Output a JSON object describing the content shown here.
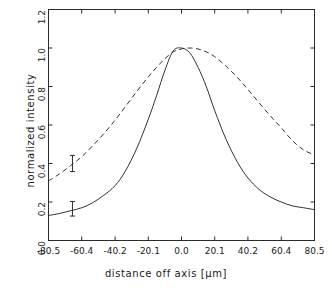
{
  "chart_data": {
    "type": "line",
    "title": "",
    "xlabel": "distance off axis [μm]",
    "ylabel": "normalized intensity",
    "xlim": [
      -80.5,
      80.5
    ],
    "ylim": [
      0.0,
      1.2
    ],
    "xticks": [
      -80.5,
      -60.4,
      -40.2,
      -20.1,
      0.0,
      20.1,
      40.2,
      60.4,
      80.5
    ],
    "xtick_labels": [
      "-80.5",
      "-60.4",
      "-40.2",
      "-20.1",
      "0.0",
      "20.1",
      "40.2",
      "60.4",
      "80.5"
    ],
    "yticks": [
      0.0,
      0.2,
      0.4,
      0.6,
      0.8,
      1.0,
      1.2
    ],
    "ytick_labels": [
      "0.0",
      "0.2",
      "0.4",
      "0.6",
      "0.8",
      "1.0",
      "1.2"
    ],
    "grid": false,
    "legend": "none",
    "series": [
      {
        "name": "solid-curve",
        "style": "solid",
        "color": "#333333",
        "x": [
          -80.5,
          -74.0,
          -67.0,
          -60.4,
          -54.0,
          -47.0,
          -40.2,
          -34.0,
          -27.0,
          -20.1,
          -15.0,
          -10.0,
          -5.0,
          0.0,
          5.0,
          10.0,
          15.0,
          20.1,
          27.0,
          34.0,
          40.2,
          47.0,
          54.0,
          60.4,
          67.0,
          74.0,
          80.5
        ],
        "y": [
          0.13,
          0.14,
          0.155,
          0.17,
          0.195,
          0.235,
          0.285,
          0.36,
          0.48,
          0.63,
          0.755,
          0.885,
          0.985,
          1.0,
          0.975,
          0.9,
          0.8,
          0.675,
          0.525,
          0.405,
          0.325,
          0.265,
          0.225,
          0.2,
          0.18,
          0.17,
          0.16
        ]
      },
      {
        "name": "dashed-curve",
        "style": "dashed",
        "color": "#333333",
        "x": [
          -80.5,
          -74.0,
          -67.0,
          -60.4,
          -54.0,
          -47.0,
          -40.2,
          -34.0,
          -27.0,
          -20.1,
          -15.0,
          -10.0,
          -5.0,
          0.0,
          5.0,
          10.0,
          15.0,
          20.1,
          27.0,
          34.0,
          40.2,
          47.0,
          54.0,
          60.4,
          67.0,
          74.0,
          80.5
        ],
        "y": [
          0.31,
          0.345,
          0.39,
          0.435,
          0.49,
          0.555,
          0.625,
          0.695,
          0.775,
          0.85,
          0.9,
          0.945,
          0.98,
          0.995,
          1.0,
          0.995,
          0.98,
          0.955,
          0.905,
          0.845,
          0.785,
          0.715,
          0.645,
          0.585,
          0.52,
          0.47,
          0.445
        ]
      }
    ],
    "error_bars": [
      {
        "name": "dashed-curve-error-bar",
        "x": -66.0,
        "y": 0.4,
        "yerr": 0.042
      },
      {
        "name": "solid-curve-error-bar",
        "x": -66.0,
        "y": 0.165,
        "yerr": 0.038
      }
    ]
  }
}
